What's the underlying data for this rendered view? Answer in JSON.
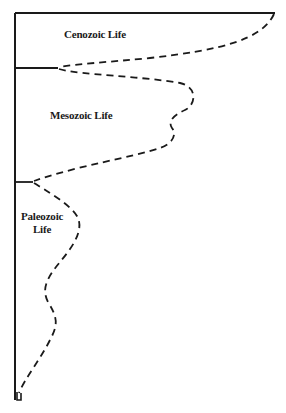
{
  "diagram": {
    "eras": [
      {
        "id": "cenozoic",
        "label": "Cenozoic Life"
      },
      {
        "id": "mesozoic",
        "label": "Mesozoic Life"
      },
      {
        "id": "paleozoic",
        "label_line1": "Paleozoic",
        "label_line2": "Life"
      }
    ],
    "colors": {
      "line": "#1a1a1a",
      "background": "#ffffff"
    },
    "axis": {
      "x": 15,
      "top": 13,
      "bottom": 400
    },
    "dividers": [
      {
        "era_boundary": "top",
        "y": 13,
        "x_end": 275
      },
      {
        "era_boundary": "cenozoic-mesozoic",
        "y": 68,
        "x_end": 58
      },
      {
        "era_boundary": "mesozoic-paleozoic",
        "y": 182,
        "x_end": 33
      }
    ]
  }
}
